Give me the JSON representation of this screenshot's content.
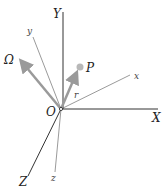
{
  "diagram": {
    "type": "rotating-reference-frame",
    "origin": {
      "label": "O",
      "x": 61,
      "y": 109
    },
    "fixed_axes": [
      {
        "name": "X",
        "label": "X",
        "end": [
          158,
          109
        ],
        "label_pos": [
          152,
          122
        ]
      },
      {
        "name": "Y",
        "label": "Y",
        "end": [
          63,
          12
        ],
        "label_pos": [
          53,
          18
        ]
      },
      {
        "name": "Z",
        "label": "Z",
        "end": [
          28,
          176
        ],
        "label_pos": [
          19,
          186
        ]
      }
    ],
    "rotating_axes": [
      {
        "name": "x",
        "label": "x",
        "end": [
          130,
          75
        ],
        "label_pos": [
          134,
          79
        ]
      },
      {
        "name": "y",
        "label": "y",
        "end": [
          33,
          37
        ],
        "label_pos": [
          27,
          34
        ]
      },
      {
        "name": "z",
        "label": "z",
        "end": [
          55,
          172
        ],
        "label_pos": [
          51,
          181
        ]
      }
    ],
    "vectors": [
      {
        "name": "Omega",
        "label": "Ω",
        "end": [
          18,
          58
        ],
        "label_pos": [
          5,
          64
        ]
      },
      {
        "name": "r",
        "label": "r",
        "end": [
          78,
          70
        ],
        "label_pos": [
          74,
          98
        ]
      }
    ],
    "point": {
      "label": "P",
      "x": 80,
      "y": 67,
      "label_pos": [
        86,
        72
      ]
    },
    "colors": {
      "axis": "#333333",
      "vector": "#9a9a9a",
      "point": "#b8b8b8"
    }
  }
}
